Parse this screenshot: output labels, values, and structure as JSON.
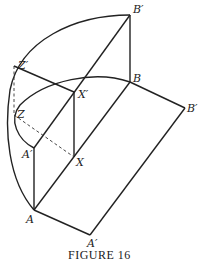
{
  "figure": {
    "caption": "FIGURE 16",
    "labels": {
      "B_prime_top": "B′",
      "B": "B",
      "B_prime_right": "B′",
      "Z_prime": "Z′",
      "X_prime": "X′",
      "Z": "Z",
      "A_prime_inner": "A′",
      "X": "X",
      "A": "A",
      "A_prime_bottom": "A′"
    },
    "points": {
      "B_prime_top": [
        130,
        15
      ],
      "B": [
        130,
        82
      ],
      "B_prime_right": [
        185,
        108
      ],
      "Z_prime": [
        14,
        66
      ],
      "X_prime": [
        74,
        92
      ],
      "Z": [
        14,
        115
      ],
      "A_prime_inner": [
        34,
        148
      ],
      "X": [
        74,
        157
      ],
      "A": [
        34,
        210
      ],
      "A_prime_bottom": [
        90,
        235
      ]
    }
  }
}
